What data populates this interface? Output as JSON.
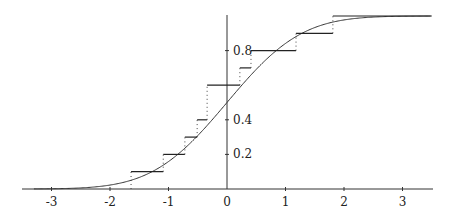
{
  "chart_data": {
    "type": "line",
    "title": "",
    "xlabel": "",
    "ylabel": "",
    "xlim": [
      -3.5,
      3.5
    ],
    "ylim": [
      0,
      1
    ],
    "grid": false,
    "legend": null,
    "x_ticks": [
      -3,
      -2,
      -1,
      0,
      1,
      2,
      3
    ],
    "x_tick_labels": [
      "-3",
      "-2",
      "-1",
      "0",
      "1",
      "2",
      "3"
    ],
    "y_ticks": [
      0.2,
      0.4,
      0.8
    ],
    "y_tick_labels": [
      "0.2",
      "0.4",
      "0.8"
    ],
    "series": [
      {
        "name": "Empirical CDF (step)",
        "style": "step",
        "jump_x": [
          -1.64,
          -1.09,
          -0.72,
          -0.51,
          -0.34,
          0.22,
          0.41,
          1.18,
          1.81
        ],
        "levels": [
          0.1,
          0.2,
          0.3,
          0.4,
          0.6,
          0.7,
          0.8,
          0.9,
          1.0
        ],
        "vertical_jumps": "dotted"
      },
      {
        "name": "Normal CDF",
        "style": "smooth",
        "function": "Phi(x), standard normal CDF",
        "x": [
          -3.5,
          -3,
          -2,
          -1,
          0,
          1,
          2,
          3,
          3.5
        ],
        "y": [
          0.0002,
          0.0013,
          0.0228,
          0.1587,
          0.5,
          0.8413,
          0.9772,
          0.9987,
          0.9998
        ]
      }
    ]
  }
}
